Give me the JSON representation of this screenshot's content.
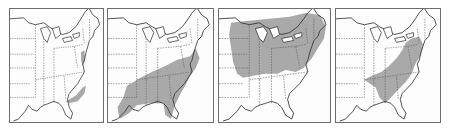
{
  "figure": {
    "colors": {
      "background": "#ffffff",
      "outline": "#3a3a3a",
      "range_fill": "#a9a9a9",
      "frame": "#6e6e6e"
    },
    "panels": [
      {
        "index": 1,
        "left": 9,
        "width": 95,
        "range_label": "Coastal range: Atlantic coast Maryland/Virginia, coastal Carolinas and Georgia to northern Florida",
        "range": "M84,44 L88,42 L89,52 L86,58 L84,52 Z M78,88 L86,80 L90,78 L88,86 L80,94 L70,96 L66,94 Z"
      },
      {
        "index": 2,
        "left": 107,
        "width": 107,
        "range_label": "Southeastern range: lower Mississippi valley, Gulf states and southern Atlantic states",
        "range": "M20,78 L34,70 L46,64 L60,58 L72,52 L86,48 L92,40 L96,50 L92,60 L86,68 L82,76 L76,86 L70,98 L66,112 L60,108 L58,96 L44,96 L30,98 L22,106 L12,112 L10,100 L16,90 Z"
      },
      {
        "index": 3,
        "left": 218,
        "width": 113,
        "range_label": "Northern range: Great Lakes, Ohio valley, New England, northern Appalachians",
        "range": "M12,14 L30,12 L50,10 L70,8 L86,4 L100,6 L106,18 L104,30 L98,40 L92,50 L84,60 L76,64 L66,62 L58,66 L46,66 L34,68 L24,70 L18,66 L14,54 L12,40 L10,26 Z"
      },
      {
        "index": 4,
        "left": 335,
        "width": 106,
        "range_label": "Appalachian range: Pennsylvania south through the Appalachians to Georgia and Alabama",
        "range": "M80,30 L88,28 L92,36 L90,46 L84,56 L80,66 L74,74 L66,82 L58,90 L52,96 L46,90 L42,80 L36,76 L30,72 L38,68 L48,64 L56,58 L64,50 L70,42 L74,34 Z"
      }
    ]
  }
}
